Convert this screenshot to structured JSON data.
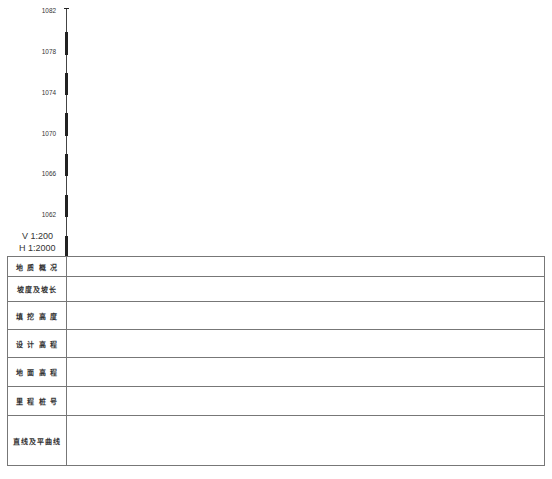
{
  "axis": {
    "ticks": [
      {
        "label": "1082",
        "y": 11
      },
      {
        "label": "1078",
        "y": 52
      },
      {
        "label": "1074",
        "y": 93
      },
      {
        "label": "1070",
        "y": 134
      },
      {
        "label": "1066",
        "y": 174
      },
      {
        "label": "1062",
        "y": 215
      }
    ]
  },
  "scale": {
    "vertical": "V 1:200",
    "horizontal": "H 1:2000"
  },
  "table": {
    "rows": [
      {
        "label": "地 质 概 况",
        "height": 20
      },
      {
        "label": "坡度及坡长",
        "height": 25
      },
      {
        "label": "填 挖 高 度",
        "height": 28
      },
      {
        "label": "设 计 高 程",
        "height": 28
      },
      {
        "label": "地 面 高 程",
        "height": 29
      },
      {
        "label": "里 程 桩 号",
        "height": 29
      },
      {
        "label": "直线及平曲线",
        "height": 50
      }
    ]
  }
}
